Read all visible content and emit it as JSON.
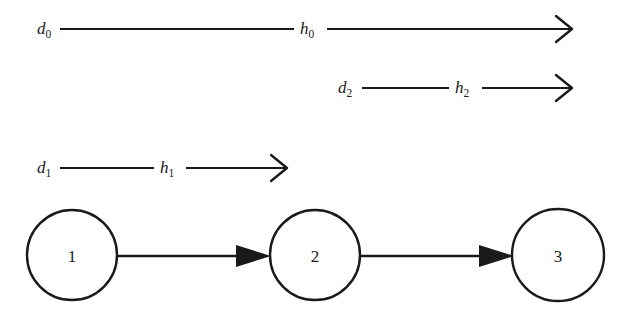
{
  "figure": {
    "background_color": "#ffffff",
    "ink_color": "#1a1a1a",
    "width": 636,
    "height": 322
  },
  "arrow_rows": [
    {
      "id": "row-0",
      "left_label": {
        "base": "d",
        "sub": "0",
        "text": "d0",
        "x": 37,
        "y": 34
      },
      "right_label": {
        "base": "h",
        "sub": "0",
        "text": "h0",
        "x": 300,
        "y": 34
      },
      "segments": [
        {
          "x1": 60,
          "y1": 29,
          "x2": 294,
          "y2": 29
        },
        {
          "x1": 327,
          "y1": 29,
          "x2": 570,
          "y2": 29
        }
      ],
      "arrowhead": {
        "type": "open-v",
        "tip_x": 572,
        "tip_y": 29
      }
    },
    {
      "id": "row-2",
      "left_label": {
        "base": "d",
        "sub": "2",
        "text": "d2",
        "x": 338,
        "y": 93
      },
      "right_label": {
        "base": "h",
        "sub": "2",
        "text": "h2",
        "x": 455,
        "y": 93
      },
      "segments": [
        {
          "x1": 362,
          "y1": 88,
          "x2": 449,
          "y2": 88
        },
        {
          "x1": 482,
          "y1": 88,
          "x2": 570,
          "y2": 88
        }
      ],
      "arrowhead": {
        "type": "open-v",
        "tip_x": 572,
        "tip_y": 88
      }
    },
    {
      "id": "row-1",
      "left_label": {
        "base": "d",
        "sub": "1",
        "text": "d1",
        "x": 37,
        "y": 173
      },
      "right_label": {
        "base": "h",
        "sub": "1",
        "text": "h1",
        "x": 160,
        "y": 173
      },
      "segments": [
        {
          "x1": 60,
          "y1": 168,
          "x2": 154,
          "y2": 168
        },
        {
          "x1": 186,
          "y1": 168,
          "x2": 285,
          "y2": 168
        }
      ],
      "arrowhead": {
        "type": "open-v",
        "tip_x": 287,
        "tip_y": 168
      }
    }
  ],
  "nodes": [
    {
      "id": "node-1",
      "label": "1",
      "cx": 72,
      "cy": 255,
      "r": 45
    },
    {
      "id": "node-2",
      "label": "2",
      "cx": 315,
      "cy": 255,
      "r": 45
    },
    {
      "id": "node-3",
      "label": "3",
      "cx": 558,
      "cy": 255,
      "r": 46
    }
  ],
  "edges": [
    {
      "id": "edge-1-2",
      "from": "node-1",
      "to": "node-2",
      "line": {
        "x1": 117,
        "y1": 256,
        "x2": 240,
        "y2": 256
      },
      "arrowhead": {
        "type": "solid-triangle",
        "tip_x": 271,
        "tip_y": 256,
        "back_x": 236,
        "half_height": 11
      }
    },
    {
      "id": "edge-2-3",
      "from": "node-2",
      "to": "node-3",
      "line": {
        "x1": 360,
        "y1": 256,
        "x2": 483,
        "y2": 256
      },
      "arrowhead": {
        "type": "solid-triangle",
        "tip_x": 514,
        "tip_y": 256,
        "back_x": 479,
        "half_height": 11
      }
    }
  ]
}
